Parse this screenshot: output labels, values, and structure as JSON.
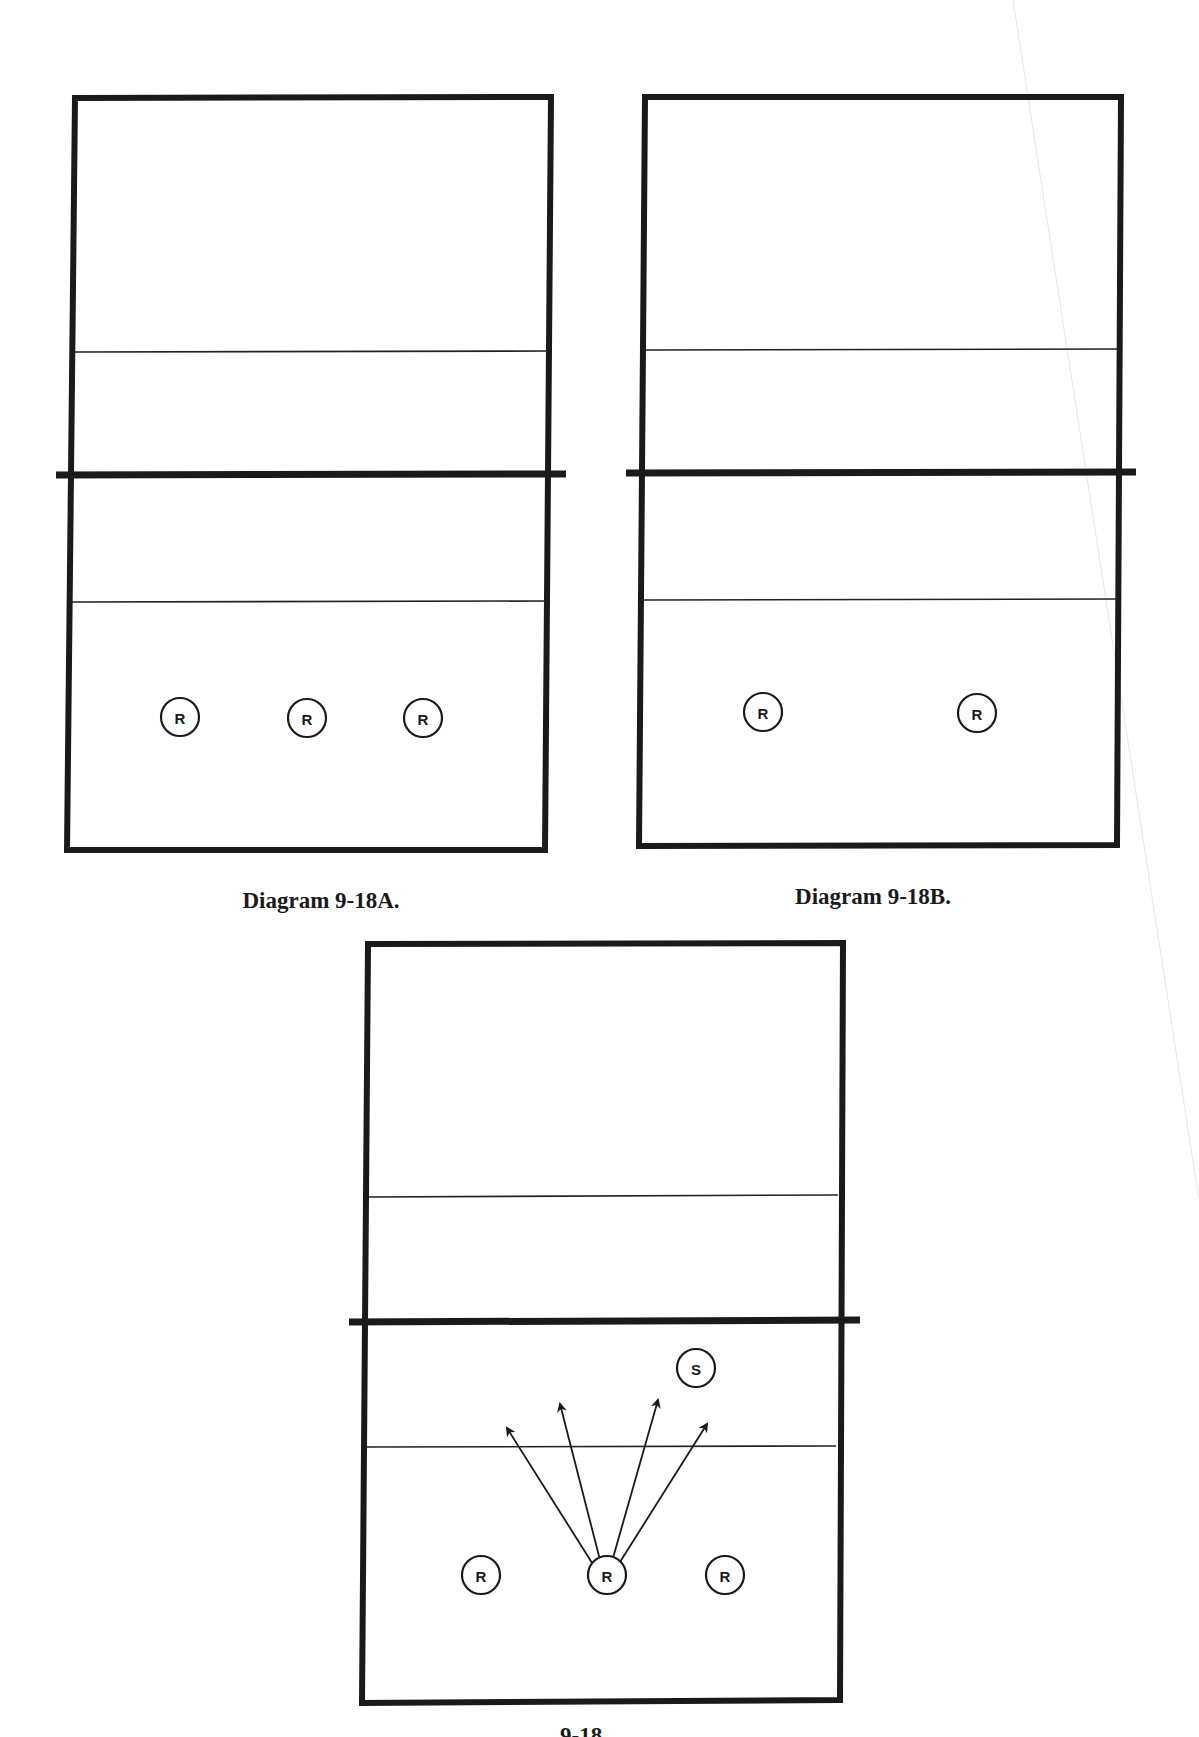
{
  "diagrams": [
    {
      "id": "A",
      "caption": "Diagram 9-18A.",
      "players": [
        {
          "label": "R",
          "role": "receiver"
        },
        {
          "label": "R",
          "role": "receiver"
        },
        {
          "label": "R",
          "role": "receiver"
        }
      ]
    },
    {
      "id": "B",
      "caption": "Diagram 9-18B.",
      "players": [
        {
          "label": "R",
          "role": "receiver"
        },
        {
          "label": "R",
          "role": "receiver"
        }
      ]
    },
    {
      "id": "C",
      "caption": "",
      "players": [
        {
          "label": "S",
          "role": "setter"
        },
        {
          "label": "R",
          "role": "receiver"
        },
        {
          "label": "R",
          "role": "receiver"
        },
        {
          "label": "R",
          "role": "receiver"
        }
      ],
      "arrows_from_center_receiver": 4
    }
  ],
  "bottom_partial_caption": "9-18"
}
